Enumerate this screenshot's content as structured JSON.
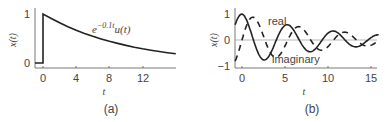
{
  "chart_data": [
    {
      "type": "line",
      "panel": "(a)",
      "title": "",
      "xlabel": "t",
      "ylabel": "x(t)",
      "xticks": [
        0,
        4,
        8,
        12
      ],
      "yticks": [
        0,
        1
      ],
      "xlim": [
        -1,
        16
      ],
      "ylim": [
        -0.05,
        1.05
      ],
      "annotation": "e^{-0.1t}u(t)",
      "series": [
        {
          "name": "e^{-0.1t}u(t)",
          "style": "solid",
          "x": [
            -1,
            0,
            0,
            2,
            4,
            6,
            8,
            10,
            12,
            14,
            16
          ],
          "values": [
            0,
            0,
            1,
            0.82,
            0.67,
            0.55,
            0.45,
            0.37,
            0.3,
            0.25,
            0.2
          ]
        }
      ]
    },
    {
      "type": "line",
      "panel": "(b)",
      "title": "",
      "xlabel": "t",
      "ylabel": "x(t)",
      "xticks": [
        0,
        5,
        10,
        15
      ],
      "yticks": [
        -1,
        0,
        1
      ],
      "xlim": [
        -1,
        16
      ],
      "ylim": [
        -1,
        1.05
      ],
      "annotations": [
        "real",
        "imaginary"
      ],
      "series": [
        {
          "name": "real",
          "style": "solid",
          "formula": "e^{-0.1t}cos(1.18t)",
          "x": [
            0,
            2.66,
            5.32,
            7.98,
            10.64,
            13.3
          ],
          "values": [
            1,
            -0.77,
            0.59,
            -0.45,
            0.35,
            -0.26
          ]
        },
        {
          "name": "imaginary",
          "style": "dashed",
          "formula": "e^{-0.1t}sin(1.18t)",
          "x": [
            0,
            1.33,
            3.99,
            6.65,
            9.31,
            11.97
          ],
          "values": [
            0,
            0.88,
            -0.67,
            0.51,
            -0.39,
            0.3
          ]
        }
      ]
    }
  ],
  "labels": {
    "a": {
      "ylabel": "x(t)",
      "xlabel": "t",
      "caption": "(a)",
      "curve": "e",
      "exp": "−0.1t",
      "tail": "u(t)",
      "xticks": [
        "0",
        "4",
        "8",
        "12"
      ],
      "yticks": [
        "0",
        "1"
      ]
    },
    "b": {
      "ylabel": "x(t)",
      "xlabel": "t",
      "caption": "(b)",
      "real": "real",
      "imag": "imaginary",
      "xticks": [
        "0",
        "5",
        "10",
        "15"
      ],
      "yticks": [
        "1",
        "0",
        "−1"
      ]
    }
  }
}
